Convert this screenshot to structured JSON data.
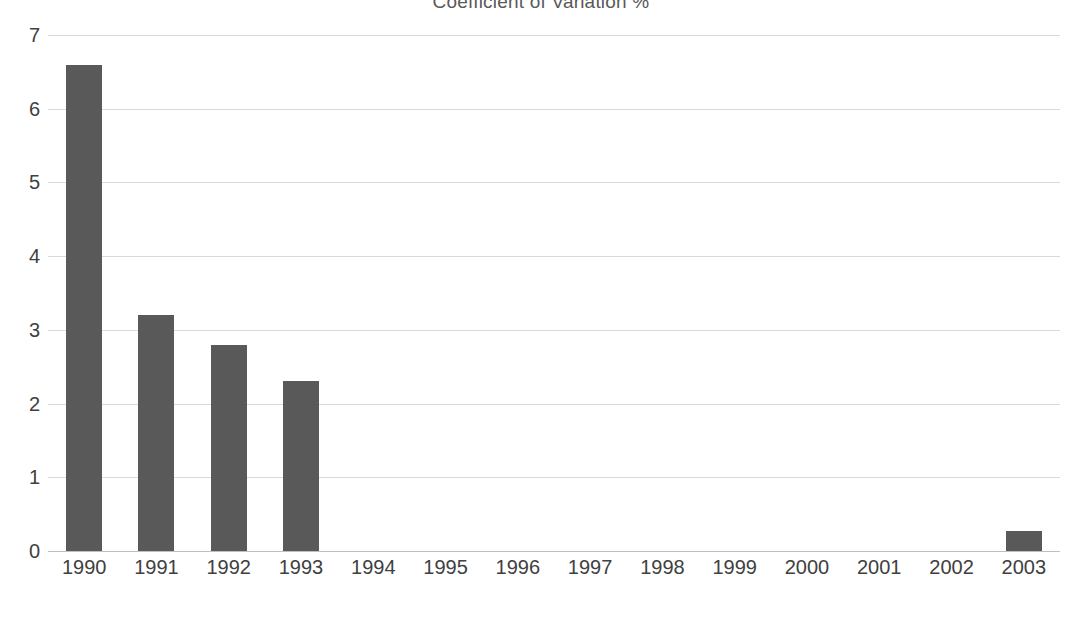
{
  "chart_data": {
    "type": "bar",
    "title": "Coefficient of Variation %",
    "xlabel": "",
    "ylabel": "",
    "categories": [
      "1990",
      "1991",
      "1992",
      "1993",
      "1994",
      "1995",
      "1996",
      "1997",
      "1998",
      "1999",
      "2000",
      "2001",
      "2002",
      "2003"
    ],
    "values": [
      6.6,
      3.2,
      2.8,
      2.3,
      0,
      0,
      0,
      0,
      0,
      0,
      0,
      0,
      0,
      0.27
    ],
    "series": [
      {
        "name": "Coefficient of Variation %",
        "values": [
          6.6,
          3.2,
          2.8,
          2.3,
          0,
          0,
          0,
          0,
          0,
          0,
          0,
          0,
          0,
          0.27
        ]
      }
    ],
    "ylim": [
      0,
      7
    ],
    "yticks": [
      0,
      1,
      2,
      3,
      4,
      5,
      6,
      7
    ],
    "ytick_labels": [
      "0",
      "1",
      "2",
      "3",
      "4",
      "5",
      "6",
      "7"
    ],
    "grid": true,
    "grid_axis": "y",
    "legend": false,
    "legend_position": "none",
    "bar_color": "#595959",
    "gridline_color": "#d9d9d9",
    "axis_text_color": "#404040",
    "title_color": "#595959",
    "background_color": "#ffffff",
    "annotations": []
  }
}
